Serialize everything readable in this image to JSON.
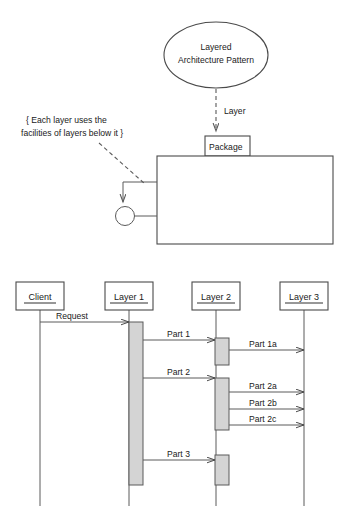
{
  "diagram": {
    "title": "Layered Architecture Pattern",
    "pattern_node": {
      "label_line1": "Layered",
      "label_line2": "Architecture Pattern",
      "shape": "ellipse"
    },
    "stereotype_link": {
      "label": "Layer",
      "style": "dashed-arrow"
    },
    "package": {
      "tab_label": "Package",
      "shape": "uml-package"
    },
    "note": {
      "text_line1": "{ Each layer uses the",
      "text_line2": "facilities of layers below it }",
      "connector": "dashed"
    },
    "self_association": {
      "shape": "loop-with-circle-end"
    }
  },
  "sequence": {
    "lifelines": [
      {
        "name": "Client",
        "x": 40
      },
      {
        "name": "Layer 1",
        "x": 129
      },
      {
        "name": "Layer 2",
        "x": 216
      },
      {
        "name": "Layer 3",
        "x": 304
      }
    ],
    "messages": [
      {
        "label": "Request",
        "from": "Client",
        "to": "Layer 1",
        "y": 322
      },
      {
        "label": "Part 1",
        "from": "Layer 1",
        "to": "Layer 2",
        "y": 340
      },
      {
        "label": "Part 1a",
        "from": "Layer 2",
        "to": "Layer 3",
        "y": 350
      },
      {
        "label": "Part 2",
        "from": "Layer 1",
        "to": "Layer 2",
        "y": 378
      },
      {
        "label": "Part 2a",
        "from": "Layer 2",
        "to": "Layer 3",
        "y": 392
      },
      {
        "label": "Part 2b",
        "from": "Layer 2",
        "to": "Layer 3",
        "y": 409
      },
      {
        "label": "Part 2c",
        "from": "Layer 2",
        "to": "Layer 3",
        "y": 425
      },
      {
        "label": "Part 3",
        "from": "Layer 1",
        "to": "Layer 2",
        "y": 460
      }
    ]
  },
  "colors": {
    "line": "#4a4a4a",
    "activation_fill": "#d4d4d4",
    "text": "#1a1a1a",
    "background": "#ffffff"
  }
}
